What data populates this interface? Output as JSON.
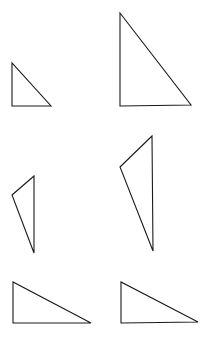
{
  "diagram": {
    "background": "#ffffff",
    "stroke_color": "#1a1a1a",
    "triangles": [
      {
        "id": "triangle-1",
        "row": 1,
        "col": 1,
        "type": "right-triangle-small",
        "points": "12,63 12,106 51,106"
      },
      {
        "id": "triangle-2",
        "row": 1,
        "col": 2,
        "type": "right-triangle-large",
        "points": "120,13 120,106 191,105"
      },
      {
        "id": "triangle-3",
        "row": 2,
        "col": 1,
        "type": "obtuse-triangle-small",
        "points": "34,176 12,195 34,253"
      },
      {
        "id": "triangle-4",
        "row": 2,
        "col": 2,
        "type": "obtuse-triangle-large",
        "points": "152,136 120,167 153,251"
      },
      {
        "id": "triangle-5",
        "row": 3,
        "col": 1,
        "type": "right-triangle-wide",
        "points": "13,282 13,323 91,323"
      },
      {
        "id": "triangle-6",
        "row": 3,
        "col": 2,
        "type": "right-triangle-wide",
        "points": "121,282 121,323 198,322"
      }
    ]
  }
}
